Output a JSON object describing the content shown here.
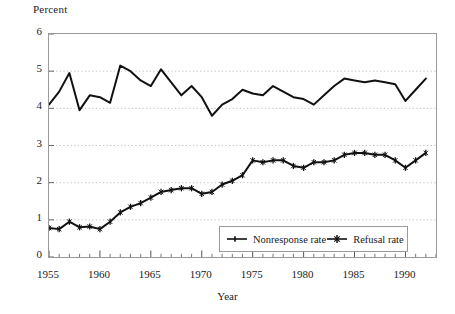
{
  "chart_data": {
    "type": "line",
    "title": "",
    "xlabel": "Year",
    "ylabel": "Percent",
    "xlim": [
      1955,
      1993
    ],
    "ylim": [
      0,
      6
    ],
    "grid": true,
    "grid_style": "dotted-horizontal",
    "legend_position": "inside-bottom-center",
    "y_ticks": [
      "0",
      "1",
      "2",
      "3",
      "4",
      "5",
      "6"
    ],
    "x_ticks": [
      "1955",
      "1960",
      "1965",
      "1970",
      "1975",
      "1980",
      "1985",
      "1990"
    ],
    "x": [
      1955,
      1956,
      1957,
      1958,
      1959,
      1960,
      1961,
      1962,
      1963,
      1964,
      1965,
      1966,
      1967,
      1968,
      1969,
      1970,
      1971,
      1972,
      1973,
      1974,
      1975,
      1976,
      1977,
      1978,
      1979,
      1980,
      1981,
      1982,
      1983,
      1984,
      1985,
      1986,
      1987,
      1988,
      1989,
      1990,
      1991,
      1992
    ],
    "series": [
      {
        "name": "Nonresponse rate",
        "marker": "dash",
        "values": [
          4.1,
          4.45,
          4.95,
          3.95,
          4.35,
          4.3,
          4.15,
          5.15,
          5.0,
          4.75,
          4.6,
          5.05,
          4.7,
          4.35,
          4.6,
          4.3,
          3.8,
          4.1,
          4.25,
          4.5,
          4.4,
          4.35,
          4.6,
          4.45,
          4.3,
          4.25,
          4.1,
          4.35,
          4.6,
          4.8,
          4.75,
          4.7,
          4.75,
          4.7,
          4.65,
          4.2,
          4.5,
          4.8
        ]
      },
      {
        "name": "Refusal rate",
        "marker": "star",
        "values": [
          0.78,
          0.75,
          0.95,
          0.8,
          0.82,
          0.75,
          0.95,
          1.2,
          1.35,
          1.45,
          1.6,
          1.75,
          1.8,
          1.85,
          1.85,
          1.7,
          1.75,
          1.95,
          2.05,
          2.2,
          2.6,
          2.55,
          2.6,
          2.6,
          2.45,
          2.4,
          2.55,
          2.55,
          2.6,
          2.75,
          2.8,
          2.8,
          2.75,
          2.75,
          2.6,
          2.4,
          2.6,
          2.8
        ]
      }
    ]
  },
  "legend": {
    "items": [
      {
        "label": "Nonresponse rate"
      },
      {
        "label": "Refusal rate"
      }
    ]
  },
  "axes": {
    "y_axis_caption": "Percent",
    "x_axis_caption": "Year"
  },
  "colors": {
    "line": "#111111",
    "frame": "#9a9a9a",
    "grid": "#b9b9b9",
    "background": "#ffffff"
  }
}
